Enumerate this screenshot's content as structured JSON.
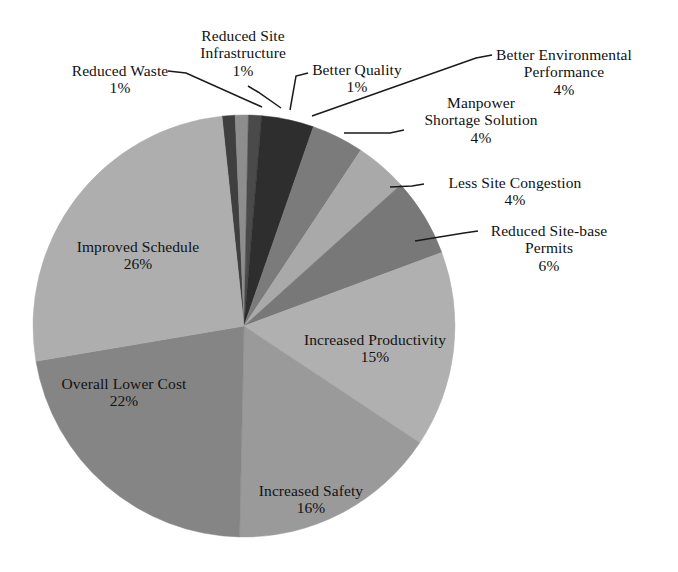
{
  "chart_data": {
    "type": "pie",
    "title": "",
    "subtitle": "",
    "xlabel": "",
    "ylabel": "",
    "legend_position": "none",
    "grid": false,
    "label_format": "name + percent",
    "units": "percent",
    "total": 100,
    "center": {
      "x": 244,
      "y": 326,
      "radius": 211
    },
    "start_angle_deg": -96,
    "direction": "clockwise",
    "categories": [
      "Reduced Waste",
      "Reduced Site Infrastructure",
      "Better Quality",
      "Better Environmental Performance",
      "Manpower Shortage Solution",
      "Less Site Congestion",
      "Reduced Site-base Permits",
      "Increased Productivity",
      "Increased Safety",
      "Overall Lower Cost",
      "Improved Schedule"
    ],
    "values": [
      1,
      1,
      1,
      4,
      4,
      4,
      6,
      15,
      16,
      22,
      26
    ],
    "slices": [
      {
        "name": "Reduced Waste",
        "value": 1,
        "percent_label": "1%",
        "color": "#3f3f3f",
        "label_style": "callout"
      },
      {
        "name": "Reduced Site Infrastructure",
        "value": 1,
        "percent_label": "1%",
        "color": "#8d8d8d",
        "label_style": "callout"
      },
      {
        "name": "Better Quality",
        "value": 1,
        "percent_label": "1%",
        "color": "#4a4a4a",
        "label_style": "callout"
      },
      {
        "name": "Better Environmental Performance",
        "value": 4,
        "percent_label": "4%",
        "color": "#2e2e2e",
        "label_style": "callout"
      },
      {
        "name": "Manpower Shortage Solution",
        "value": 4,
        "percent_label": "4%",
        "color": "#7b7b7b",
        "label_style": "callout"
      },
      {
        "name": "Less Site Congestion",
        "value": 4,
        "percent_label": "4%",
        "color": "#a9a9a9",
        "label_style": "callout"
      },
      {
        "name": "Reduced Site-base Permits",
        "value": 6,
        "percent_label": "6%",
        "color": "#787878",
        "label_style": "callout"
      },
      {
        "name": "Increased Productivity",
        "value": 15,
        "percent_label": "15%",
        "color": "#b0b0b0",
        "label_style": "inner"
      },
      {
        "name": "Increased Safety",
        "value": 16,
        "percent_label": "16%",
        "color": "#9a9a9a",
        "label_style": "inner"
      },
      {
        "name": "Overall Lower Cost",
        "value": 22,
        "percent_label": "22%",
        "color": "#858585",
        "label_style": "inner"
      },
      {
        "name": "Improved Schedule",
        "value": 26,
        "percent_label": "26%",
        "color": "#aeaeae",
        "label_style": "inner"
      }
    ]
  },
  "labels": {
    "reduced_waste": {
      "name": "Reduced Waste",
      "value": "1%"
    },
    "reduced_site_infra": {
      "line1": "Reduced Site",
      "line2": "Infrastructure",
      "value": "1%"
    },
    "better_quality": {
      "name": "Better Quality",
      "value": "1%"
    },
    "better_env": {
      "line1": "Better Environmental",
      "line2": "Performance",
      "value": "4%"
    },
    "manpower": {
      "line1": "Manpower",
      "line2": "Shortage Solution",
      "value": "4%"
    },
    "less_congestion": {
      "name": "Less Site Congestion",
      "value": "4%"
    },
    "reduced_permits": {
      "line1": "Reduced Site-base",
      "line2": "Permits",
      "value": "6%"
    },
    "improved_schedule": {
      "name": "Improved Schedule",
      "value": "26%"
    },
    "overall_lower_cost": {
      "name": "Overall Lower Cost",
      "value": "22%"
    },
    "increased_safety": {
      "name": "Increased Safety",
      "value": "16%"
    },
    "increased_prod": {
      "name": "Increased Productivity",
      "value": "15%"
    }
  },
  "colors": {
    "background": "#ffffff",
    "text": "#111111",
    "leader_line": "#1a1a1a"
  }
}
